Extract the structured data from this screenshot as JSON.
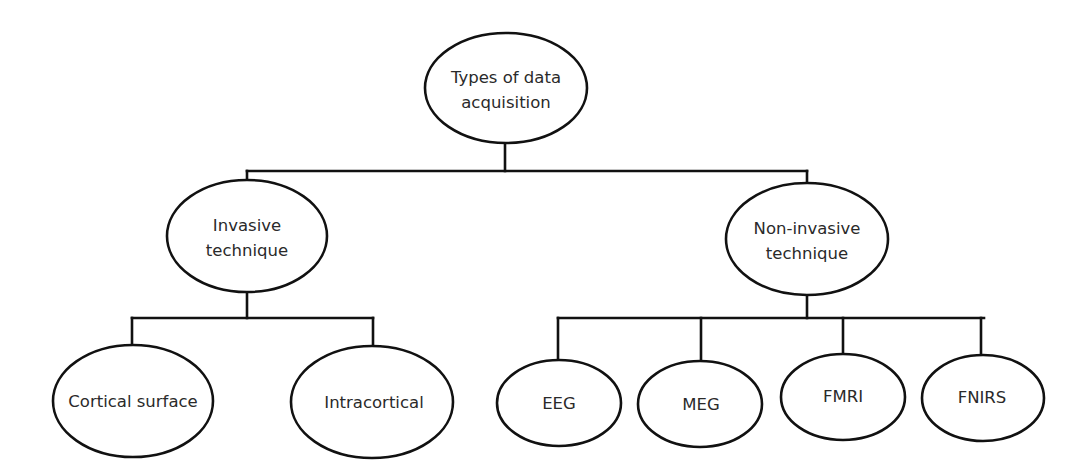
{
  "diagram": {
    "type": "tree",
    "root": {
      "label_lines": [
        "Types of data",
        "acquisition"
      ]
    },
    "branches": [
      {
        "label_lines": [
          "Invasive",
          "technique"
        ],
        "children": [
          {
            "label": "Cortical surface"
          },
          {
            "label": "Intracortical"
          }
        ]
      },
      {
        "label_lines": [
          "Non-invasive",
          "technique"
        ],
        "children": [
          {
            "label": "EEG"
          },
          {
            "label": "MEG"
          },
          {
            "label": "FMRI"
          },
          {
            "label": "FNIRS"
          }
        ]
      }
    ],
    "colors": {
      "line": "#111111",
      "text": "#2a2a2a",
      "background": "#ffffff"
    }
  }
}
